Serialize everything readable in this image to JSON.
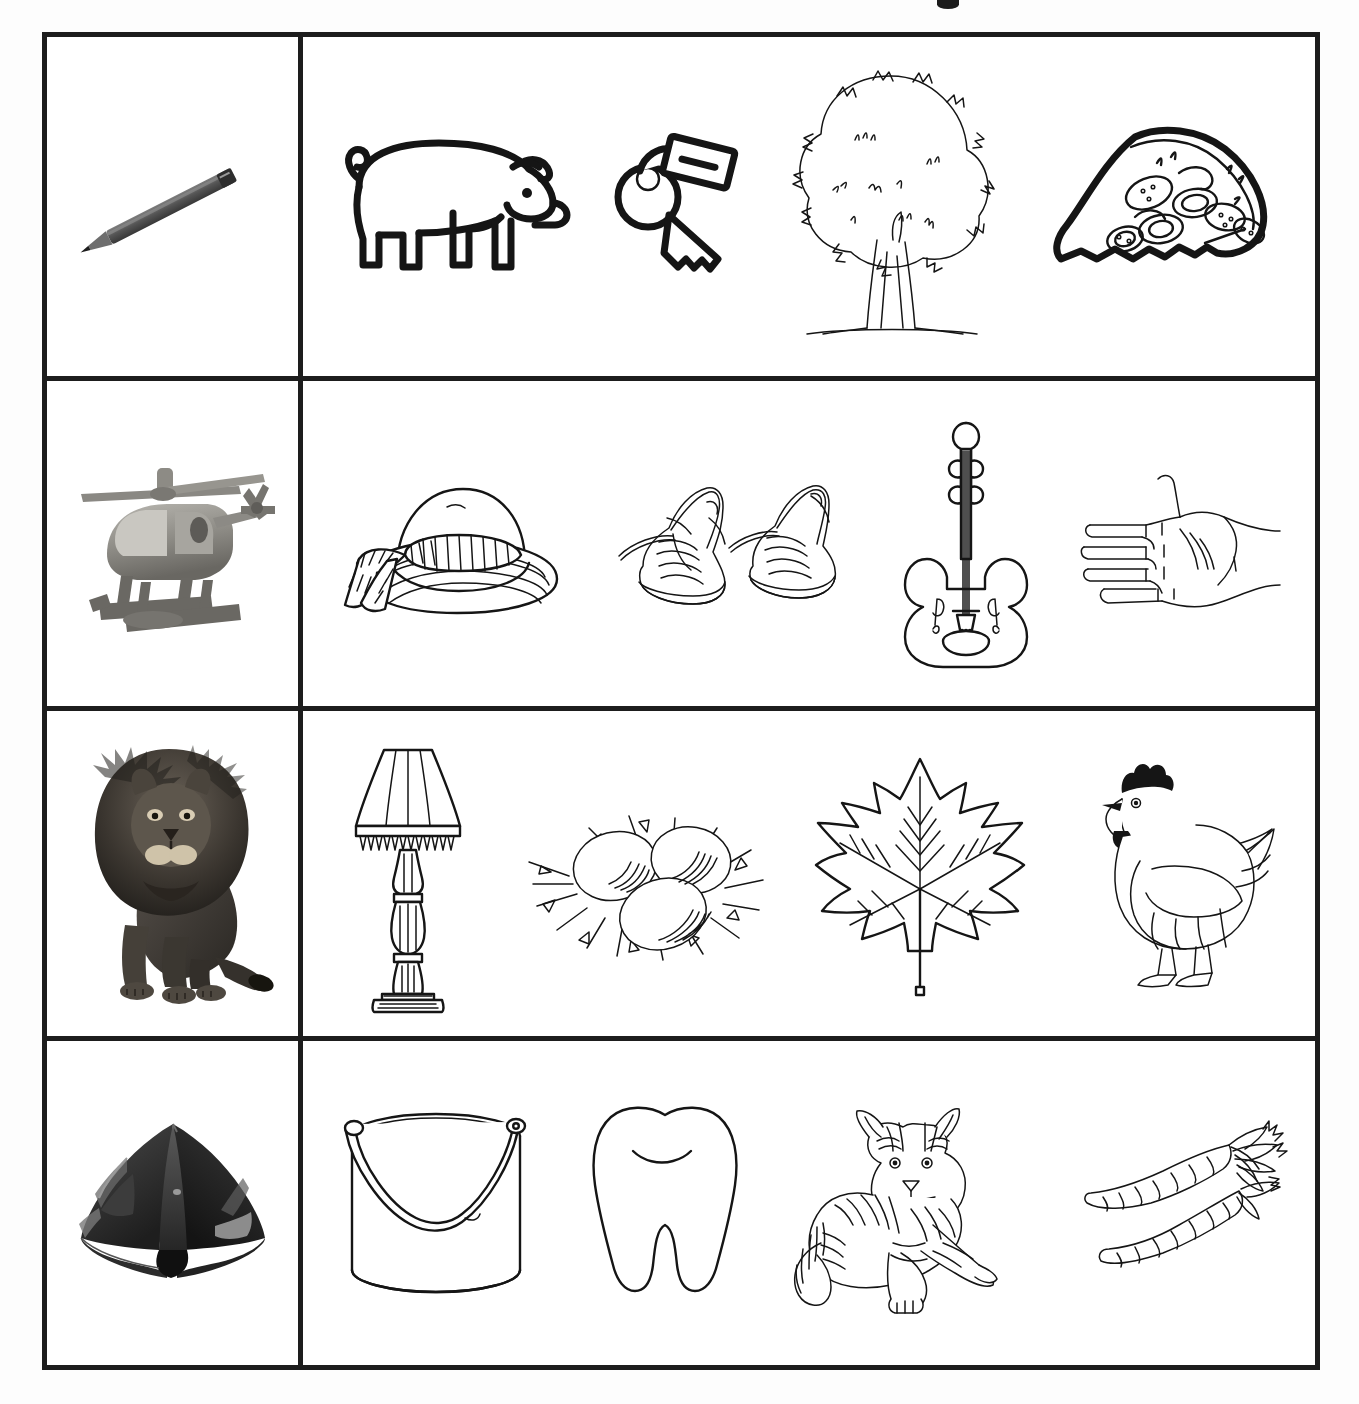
{
  "worksheet": {
    "type": "picture-matching-worksheet",
    "title_fragment_visible": "partial mark cut off at top edge of page",
    "background_color": "#fdfdfd",
    "border_color": "#1d1d1d",
    "line_art_color": "#151515",
    "columns": 2,
    "rows": 4,
    "cue_column_label": "cue-picture",
    "options_column_label": "option-pictures",
    "options_per_row": 4
  },
  "rows": [
    {
      "index": 1,
      "cue": {
        "name": "pencil",
        "style": "grayscale-photo",
        "description": "sharpened graphite pencil angled diagonally"
      },
      "options": [
        {
          "name": "pig",
          "style": "bold-line-art",
          "description": "side view pig with curly tail"
        },
        {
          "name": "key",
          "style": "bold-line-art",
          "description": "key with round bow, serrated blade and rectangular tag"
        },
        {
          "name": "tree",
          "style": "sketch-line-art",
          "description": "broad leafy tree with textured canopy and trunk on ground line"
        },
        {
          "name": "pizza",
          "style": "bold-line-art",
          "description": "slice of pepperoni pizza with crust"
        }
      ]
    },
    {
      "index": 2,
      "cue": {
        "name": "helicopter",
        "style": "grayscale-photo",
        "description": "toy helicopter with rotor and landing skids"
      },
      "options": [
        {
          "name": "hat",
          "style": "sketch-line-art",
          "description": "wide brim sun hat with ribbon bow"
        },
        {
          "name": "shoes",
          "style": "sketch-line-art",
          "description": "pair of laced canvas sneakers"
        },
        {
          "name": "violin",
          "style": "line-art",
          "description": "violin seen from the front with strings and f-holes"
        },
        {
          "name": "hand",
          "style": "thin-line-art",
          "description": "open palm hand with five fingers"
        }
      ]
    },
    {
      "index": 3,
      "cue": {
        "name": "lion",
        "style": "grayscale-photo",
        "description": "male lion with full mane sitting upright"
      },
      "options": [
        {
          "name": "lamp",
          "style": "line-art",
          "description": "table lamp with fringed shade and turned base"
        },
        {
          "name": "eggs",
          "style": "sketch-line-art",
          "description": "three eggs resting in a straw nest"
        },
        {
          "name": "leaf",
          "style": "line-art",
          "description": "maple leaf with veins and stem"
        },
        {
          "name": "hen",
          "style": "thin-line-art",
          "description": "standing chicken with comb and wattle"
        }
      ]
    },
    {
      "index": 4,
      "cue": {
        "name": "tent",
        "style": "grayscale-photo",
        "description": "dark dome camping tent with mesh windows"
      },
      "options": [
        {
          "name": "bucket",
          "style": "line-art",
          "description": "cylindrical bucket with arched carry handle"
        },
        {
          "name": "tooth",
          "style": "line-art",
          "description": "molar tooth with two roots and groove line"
        },
        {
          "name": "tiger",
          "style": "thin-line-art",
          "description": "tiger lying down with stripes and long tail"
        },
        {
          "name": "carrots",
          "style": "thin-line-art",
          "description": "two carrots with leafy green tops"
        }
      ]
    }
  ]
}
